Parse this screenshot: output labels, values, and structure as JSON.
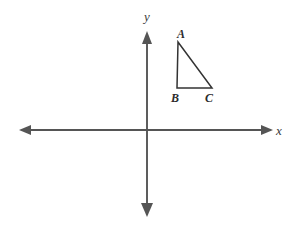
{
  "figure": {
    "type": "coordinate-plane-with-triangle",
    "background_color": "#ffffff",
    "axis_color": "#555555",
    "shape_color": "#333333",
    "axes": {
      "x_axis": {
        "label": "x",
        "label_position": {
          "x": 281,
          "y": 134
        },
        "line": {
          "x1": 22,
          "y1": 130,
          "x2": 270,
          "y2": 130
        },
        "arrow_left": true,
        "arrow_right": true
      },
      "y_axis": {
        "label": "y",
        "label_position": {
          "x": 147,
          "y": 20
        },
        "line": {
          "x1": 147,
          "y1": 35,
          "x2": 147,
          "y2": 214
        },
        "arrow_up": true,
        "arrow_down": true
      },
      "origin": {
        "x": 147,
        "y": 130
      }
    },
    "triangle": {
      "name": "triangle-ABC",
      "vertices": [
        {
          "label": "A",
          "x": 178,
          "y": 42,
          "label_x": 181,
          "label_y": 37
        },
        {
          "label": "B",
          "x": 177,
          "y": 88,
          "label_x": 171,
          "label_y": 102
        },
        {
          "label": "C",
          "x": 212,
          "y": 88,
          "label_x": 205,
          "label_y": 102
        }
      ],
      "right_angle_at": "B",
      "quadrant": "I"
    }
  }
}
